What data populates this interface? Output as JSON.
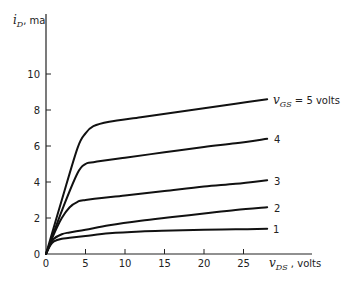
{
  "chart_data": {
    "type": "line",
    "title": "",
    "xlabel": "v_DS, volts",
    "ylabel": "i_D, ma",
    "xlim": [
      0,
      28
    ],
    "ylim": [
      0,
      12
    ],
    "grid": false,
    "legend": "inline labels at right end of curves",
    "x_ticks": [
      0,
      5,
      10,
      15,
      20,
      25
    ],
    "y_ticks": [
      0,
      2,
      4,
      6,
      8,
      10
    ],
    "series": [
      {
        "name": "v_GS = 5 volts",
        "label": "v_GS = 5 volts",
        "x": [
          0,
          2,
          4,
          5,
          6,
          8,
          12,
          16,
          20,
          24,
          28
        ],
        "y": [
          0,
          3.0,
          5.9,
          6.7,
          7.1,
          7.35,
          7.6,
          7.85,
          8.1,
          8.35,
          8.6
        ]
      },
      {
        "name": "4",
        "label": "4",
        "x": [
          0,
          2,
          4,
          5,
          6,
          10,
          15,
          20,
          24,
          28
        ],
        "y": [
          0,
          2.4,
          4.5,
          5.0,
          5.1,
          5.35,
          5.65,
          5.95,
          6.15,
          6.4
        ]
      },
      {
        "name": "3",
        "label": "3",
        "x": [
          0,
          1,
          2,
          3,
          4,
          5,
          10,
          15,
          20,
          24,
          28
        ],
        "y": [
          0,
          1.1,
          2.0,
          2.6,
          2.9,
          3.0,
          3.25,
          3.5,
          3.75,
          3.9,
          4.1
        ]
      },
      {
        "name": "2",
        "label": "2",
        "x": [
          0,
          0.5,
          1,
          2,
          3,
          5,
          8,
          12,
          16,
          20,
          24,
          28
        ],
        "y": [
          0,
          0.5,
          0.85,
          1.1,
          1.2,
          1.35,
          1.6,
          1.85,
          2.05,
          2.25,
          2.45,
          2.6
        ]
      },
      {
        "name": "1",
        "label": "1",
        "x": [
          0,
          0.5,
          1,
          2,
          3,
          5,
          8,
          12,
          16,
          20,
          24,
          28
        ],
        "y": [
          0,
          0.45,
          0.7,
          0.85,
          0.9,
          1.0,
          1.15,
          1.25,
          1.3,
          1.35,
          1.37,
          1.4
        ]
      }
    ]
  },
  "axes": {
    "y_label_main": "i",
    "y_label_sub": "D",
    "y_label_unit": ", ma",
    "x_label_main": "v",
    "x_label_sub": "DS",
    "x_label_unit": " , volts"
  },
  "curve_labels": {
    "top_main": "v",
    "top_sub": "GS",
    "top_rest": " =  5 volts",
    "c4": "4",
    "c3": "3",
    "c2": "2",
    "c1": "1"
  },
  "ticks": {
    "x": [
      "0",
      "5",
      "10",
      "15",
      "20",
      "25"
    ],
    "y": [
      "0",
      "2",
      "4",
      "6",
      "8",
      "10"
    ]
  }
}
